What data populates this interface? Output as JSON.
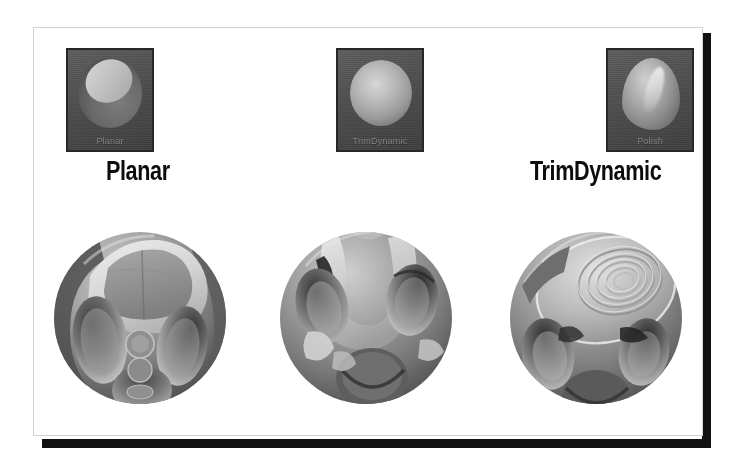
{
  "figure": {
    "background_color": "#ffffff",
    "panel_color": "#ffffff",
    "panel_border_color": "#d2d2d2",
    "shadow_color": "#121212",
    "caption_color": "#0d0d0d",
    "thumbnail_bg_color": "#4b4b4b",
    "thumbnail_border_color": "#272727",
    "thumbnail_label_color": "#8e8e8e"
  },
  "columns": [
    {
      "id": "planar",
      "caption": "Planar",
      "thumbnail_label": "Planar",
      "thumbnail_icon": "planar-surface-swatch-icon",
      "render_icon": "planar-carved-sphere-render"
    },
    {
      "id": "trimdynamic",
      "caption": "TrimDynamic",
      "thumbnail_label": "TrimDynamic",
      "thumbnail_icon": "trimdynamic-surface-swatch-icon",
      "render_icon": "trimdynamic-carved-sphere-render"
    },
    {
      "id": "polish",
      "caption": "Polish",
      "thumbnail_label": "Polish",
      "thumbnail_icon": "polish-surface-swatch-icon",
      "render_icon": "polish-carved-sphere-render"
    }
  ]
}
